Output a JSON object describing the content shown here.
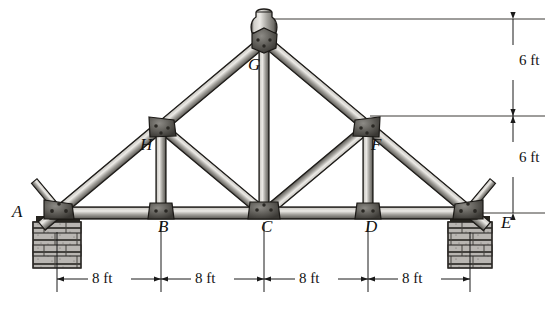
{
  "figure": {
    "type": "structural-truss-diagram",
    "background_color": "#ffffff",
    "line_color": "#1a1a1a",
    "member_fill_light": "#d8d6d2",
    "member_fill_mid": "#9c9a95",
    "member_fill_dark": "#4a4844",
    "gusset_color": "#5a5852",
    "masonry_color": "#b8b6b1"
  },
  "joints": [
    {
      "name": "A",
      "label": "A",
      "x": 57,
      "y": 213,
      "label_x": 12,
      "label_y": 203,
      "kind": "support-pin"
    },
    {
      "name": "B",
      "label": "B",
      "x": 161,
      "y": 213,
      "label_x": 158,
      "label_y": 218,
      "kind": "bottom-chord"
    },
    {
      "name": "C",
      "label": "C",
      "x": 264,
      "y": 213,
      "label_x": 261,
      "label_y": 218,
      "kind": "bottom-chord"
    },
    {
      "name": "D",
      "label": "D",
      "x": 368,
      "y": 213,
      "label_x": 365,
      "label_y": 218,
      "kind": "bottom-chord"
    },
    {
      "name": "E",
      "label": "E",
      "x": 470,
      "y": 213,
      "label_x": 501,
      "label_y": 214,
      "kind": "support-roller"
    },
    {
      "name": "F",
      "label": "F",
      "x": 368,
      "y": 127,
      "label_x": 371,
      "label_y": 136,
      "kind": "top-chord"
    },
    {
      "name": "G",
      "label": "G",
      "x": 264,
      "y": 40,
      "label_x": 248,
      "label_y": 56,
      "kind": "apex"
    },
    {
      "name": "H",
      "label": "H",
      "x": 161,
      "y": 127,
      "label_x": 140,
      "label_y": 136,
      "kind": "top-chord"
    }
  ],
  "members": [
    {
      "name": "bottom-chord-AB",
      "from": "A",
      "to": "B",
      "type": "chord"
    },
    {
      "name": "bottom-chord-BC",
      "from": "B",
      "to": "C",
      "type": "chord"
    },
    {
      "name": "bottom-chord-CD",
      "from": "C",
      "to": "D",
      "type": "chord"
    },
    {
      "name": "bottom-chord-DE",
      "from": "D",
      "to": "E",
      "type": "chord"
    },
    {
      "name": "top-chord-AH",
      "from": "A",
      "to": "H",
      "type": "chord"
    },
    {
      "name": "top-chord-HG",
      "from": "H",
      "to": "G",
      "type": "chord"
    },
    {
      "name": "top-chord-GF",
      "from": "G",
      "to": "F",
      "type": "chord"
    },
    {
      "name": "top-chord-FE",
      "from": "F",
      "to": "E",
      "type": "chord"
    },
    {
      "name": "vertical-HB",
      "from": "H",
      "to": "B",
      "type": "web"
    },
    {
      "name": "vertical-GC",
      "from": "G",
      "to": "C",
      "type": "web"
    },
    {
      "name": "vertical-FD",
      "from": "F",
      "to": "D",
      "type": "web"
    },
    {
      "name": "diagonal-HC",
      "from": "H",
      "to": "C",
      "type": "web"
    },
    {
      "name": "diagonal-FC",
      "from": "F",
      "to": "C",
      "type": "web"
    }
  ],
  "supports": [
    {
      "name": "masonry-pier-left",
      "at": "A",
      "x": 33,
      "y": 222,
      "width": 48,
      "height": 46
    },
    {
      "name": "masonry-pier-right",
      "at": "E",
      "x": 448,
      "y": 222,
      "width": 44,
      "height": 46
    }
  ],
  "dimensions": {
    "horizontal": {
      "name": "span-dimension-chain",
      "line_y": 279,
      "segments": [
        {
          "label": "8 ft",
          "from_x": 57,
          "to_x": 161,
          "text_x": 109,
          "text_y": 271
        },
        {
          "label": "8 ft",
          "from_x": 161,
          "to_x": 264,
          "text_x": 212,
          "text_y": 271
        },
        {
          "label": "8 ft",
          "from_x": 264,
          "to_x": 368,
          "text_x": 316,
          "text_y": 271
        },
        {
          "label": "8 ft",
          "from_x": 368,
          "to_x": 470,
          "text_x": 419,
          "text_y": 271
        }
      ]
    },
    "vertical": {
      "name": "height-dimension-chain",
      "line_x": 513,
      "segments": [
        {
          "label": "6 ft",
          "from_y": 19,
          "to_y": 116,
          "text_x": 519,
          "text_y": 59,
          "ref_line_from_x": 268,
          "ref_line_to_x": 545,
          "ref_y": 19
        },
        {
          "label": "6 ft",
          "from_y": 116,
          "to_y": 213,
          "text_x": 519,
          "text_y": 156,
          "ref_line_from_x": 370,
          "ref_line_to_x": 545,
          "ref_y": 116
        }
      ],
      "baseline": {
        "name": "baseline-reference",
        "from_x": 470,
        "to_x": 545,
        "y": 213
      }
    }
  },
  "apex_cap": {
    "name": "ridge-cap",
    "x": 264,
    "y": 14,
    "width": 30,
    "height": 20
  }
}
